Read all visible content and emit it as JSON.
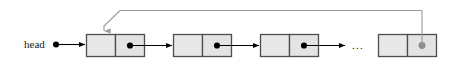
{
  "diagram": {
    "head_label": "head",
    "ellipsis_label": "...",
    "colors": {
      "background": "#ffffff",
      "node_fill": "#e3e3e3",
      "node_data_fill": "#e8e8e8",
      "node_stroke": "#4d4d4d",
      "arrow": "#000000",
      "loop_line": "#9a9a9a",
      "pointer_dot": "#000000",
      "tail_pointer_dot": "#8c8c8c",
      "text": "#1a1a1a"
    },
    "nodes": [
      {
        "id": "node-1",
        "data_cell": "",
        "pointer_cell": "",
        "pointer_dot": "filled-black"
      },
      {
        "id": "node-2",
        "data_cell": "",
        "pointer_cell": "",
        "pointer_dot": "filled-black"
      },
      {
        "id": "node-3",
        "data_cell": "",
        "pointer_cell": "",
        "pointer_dot": "filled-black"
      },
      {
        "id": "node-4",
        "data_cell": "",
        "pointer_cell": "",
        "pointer_dot": "filled-gray"
      }
    ],
    "connections": [
      {
        "id": "head-to-node-1",
        "from": "head",
        "to": "node-1",
        "style": "arrow-black"
      },
      {
        "id": "node-1-to-node-2",
        "from": "node-1",
        "to": "node-2",
        "style": "arrow-black"
      },
      {
        "id": "node-2-to-node-3",
        "from": "node-2",
        "to": "node-3",
        "style": "arrow-black"
      },
      {
        "id": "node-3-to-ellipsis",
        "from": "node-3",
        "to": "ellipsis",
        "style": "arrow-black"
      },
      {
        "id": "node-4-to-node-1",
        "from": "node-4",
        "to": "node-1",
        "style": "loop-back-gray-arrow"
      }
    ]
  }
}
